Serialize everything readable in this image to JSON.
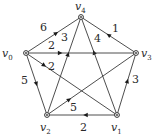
{
  "diagram": {
    "type": "directed-weighted-graph",
    "vertices": [
      {
        "id": "v0",
        "name": "v",
        "subscript": "0"
      },
      {
        "id": "v1",
        "name": "v",
        "subscript": "1"
      },
      {
        "id": "v2",
        "name": "v",
        "subscript": "2"
      },
      {
        "id": "v3",
        "name": "v",
        "subscript": "3"
      },
      {
        "id": "v4",
        "name": "v",
        "subscript": "4"
      }
    ],
    "edges": [
      {
        "from": "v0",
        "to": "v4",
        "weight": "6"
      },
      {
        "from": "v3",
        "to": "v4",
        "weight": "1"
      },
      {
        "from": "v2",
        "to": "v4",
        "weight": "3"
      },
      {
        "from": "v1",
        "to": "v4",
        "weight": "4"
      },
      {
        "from": "v0",
        "to": "v3",
        "weight": "2"
      },
      {
        "from": "v0",
        "to": "v1",
        "weight": "2"
      },
      {
        "from": "v0",
        "to": "v2",
        "weight": "5"
      },
      {
        "from": "v1",
        "to": "v3",
        "weight": "3"
      },
      {
        "from": "v2",
        "to": "v3",
        "weight": "5"
      },
      {
        "from": "v1",
        "to": "v2",
        "weight": "2"
      }
    ],
    "colors": {
      "edge": "#3a3a3a",
      "text": "#2a2a2a",
      "background": "#ffffff"
    }
  }
}
